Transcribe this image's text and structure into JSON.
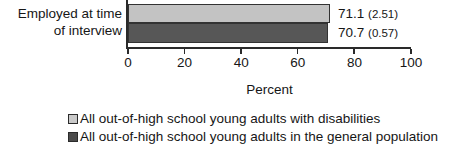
{
  "chart_data": {
    "type": "bar",
    "orientation": "horizontal",
    "title": "",
    "xlabel": "Percent",
    "ylabel": "",
    "categories": [
      "Employed at time of interview"
    ],
    "category_lines": [
      "Employed at time",
      "of interview"
    ],
    "xlim": [
      0,
      100
    ],
    "xticks": [
      0,
      20,
      40,
      60,
      80,
      100
    ],
    "xtick_labels": [
      "0",
      "20",
      "40",
      "60",
      "80",
      "100"
    ],
    "grid": false,
    "legend_position": "bottom",
    "series": [
      {
        "name": "All out-of-high school young adults with disabilities",
        "values": [
          71.1
        ],
        "standard_errors": [
          2.51
        ],
        "data_labels": [
          "71.1 (2.51)"
        ],
        "color": "#c3c3c3"
      },
      {
        "name": "All out-of-high school young adults in the general population",
        "values": [
          70.7
        ],
        "standard_errors": [
          0.57
        ],
        "data_labels": [
          "70.7 (0.57)"
        ],
        "color": "#575757"
      }
    ]
  },
  "labels": {
    "category_line_1": "Employed at time",
    "category_line_2": "of interview",
    "axis_title": "Percent",
    "tick_0": "0",
    "tick_1": "20",
    "tick_2": "40",
    "tick_3": "60",
    "tick_4": "80",
    "tick_5": "100",
    "value_0_main": "71.1",
    "value_0_se": "(2.51)",
    "value_1_main": "70.7",
    "value_1_se": "(0.57)",
    "legend_0": "All out-of-high school young adults with disabilities",
    "legend_1": "All out-of-high school young adults in the general population"
  }
}
